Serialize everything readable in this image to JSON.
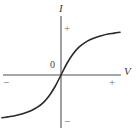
{
  "figure": {
    "partial_caption": "",
    "background_color": "#ffffff"
  },
  "axes": {
    "vertical": {
      "label": "I",
      "positive_sign": "+",
      "negative_sign": "−",
      "color": "#8a8a8a"
    },
    "horizontal": {
      "label": "V",
      "positive_sign": "+",
      "negative_sign": "−",
      "color": "#8a8a8a"
    },
    "origin_label": "0"
  },
  "curve": {
    "color": "#2a2a2a",
    "width": 1.6
  },
  "chart_data": {
    "type": "line",
    "title": "",
    "xlabel": "V",
    "ylabel": "I",
    "xlim": [
      -1,
      1
    ],
    "ylim": [
      -1,
      1
    ],
    "grid": false,
    "legend": null,
    "annotations": [
      "0",
      "+",
      "−",
      "+",
      "−"
    ],
    "series": [
      {
        "name": "I-V characteristic",
        "x": [
          -1.0,
          -0.9,
          -0.8,
          -0.7,
          -0.6,
          -0.5,
          -0.4,
          -0.3,
          -0.2,
          -0.1,
          0.0,
          0.1,
          0.2,
          0.3,
          0.4,
          0.5,
          0.6,
          0.7,
          0.8,
          0.9,
          1.0
        ],
        "y": [
          -0.93,
          -0.91,
          -0.89,
          -0.86,
          -0.82,
          -0.77,
          -0.7,
          -0.6,
          -0.45,
          -0.25,
          0.0,
          0.25,
          0.45,
          0.6,
          0.7,
          0.77,
          0.82,
          0.86,
          0.89,
          0.91,
          0.93
        ]
      }
    ]
  }
}
